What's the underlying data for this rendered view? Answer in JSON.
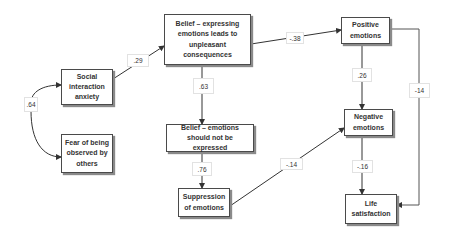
{
  "diagram": {
    "nodes": {
      "social_anxiety": "Social interaction anxiety",
      "fear_observed": "Fear of being observed by others",
      "belief_unpleasant": "Belief – expressing emotions leads to unpleasant consequences",
      "belief_not_expressed": "Belief – emotions should not be expressed",
      "suppression": "Suppression of emotions",
      "positive": "Positive emotions",
      "negative": "Negative emotions",
      "life_satisfaction": "Life satisfaction"
    },
    "edges": {
      "social_fear_cov": ".64",
      "social_to_belief": ".29",
      "belief_to_positive": "-.38",
      "belief_to_belief2": ".63",
      "belief2_to_suppression": ".76",
      "suppression_to_negative": "-.14",
      "positive_to_negative": ".26",
      "negative_to_life": "-.16",
      "positive_to_life": "-14"
    }
  }
}
